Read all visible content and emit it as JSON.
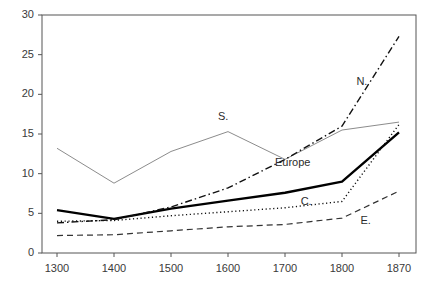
{
  "chart_data": {
    "type": "line",
    "title": "",
    "subtitle": "",
    "xlabel": "",
    "ylabel": "",
    "categories": [
      "1300",
      "1400",
      "1500",
      "1600",
      "1700",
      "1800",
      "1870"
    ],
    "xtick_labels": [
      "1300",
      "1400",
      "1500",
      "1600",
      "1700",
      "1800",
      "1870"
    ],
    "ytick_labels": [
      "0",
      "5",
      "10",
      "15",
      "20",
      "25",
      "30"
    ],
    "ytick_values": [
      0,
      5,
      10,
      15,
      20,
      25,
      30
    ],
    "ylim": [
      0,
      30
    ],
    "grid": false,
    "legend": "inline-labels",
    "legend_position": "inline",
    "series": [
      {
        "name": "S.",
        "label": "S.",
        "style": "solid-thin",
        "color": "#8c8c8c",
        "width": 1,
        "values": [
          13.2,
          8.8,
          12.8,
          15.3,
          11.8,
          15.5,
          16.5
        ],
        "label_x": 1600,
        "label_y": 17.2
      },
      {
        "name": "Europe",
        "label": "Europe",
        "style": "solid-thick",
        "color": "#000000",
        "width": 2.4,
        "values": [
          5.4,
          4.3,
          5.6,
          6.6,
          7.6,
          9.0,
          15.2
        ],
        "label_x": 1700,
        "label_y": 11.4
      },
      {
        "name": "N.",
        "label": "N.",
        "style": "dash-dot",
        "color": "#111111",
        "width": 1.4,
        "values": [
          3.8,
          4.2,
          5.8,
          8.2,
          11.8,
          16.0,
          27.3
        ],
        "label_x": 1830,
        "label_y": 21.6
      },
      {
        "name": "C.",
        "label": "C.",
        "style": "dotted",
        "color": "#111111",
        "width": 1.4,
        "values": [
          4.0,
          4.1,
          4.7,
          5.2,
          5.7,
          6.5,
          16.2
        ],
        "label_x": 1745,
        "label_y": 6.4
      },
      {
        "name": "E.",
        "label": "E.",
        "style": "dashed",
        "color": "#333333",
        "width": 1.2,
        "values": [
          2.2,
          2.3,
          2.8,
          3.3,
          3.6,
          4.4,
          7.8
        ],
        "label_x": 1835,
        "label_y": 4.0
      }
    ],
    "axis_color": "#555555",
    "background": "#ffffff"
  }
}
